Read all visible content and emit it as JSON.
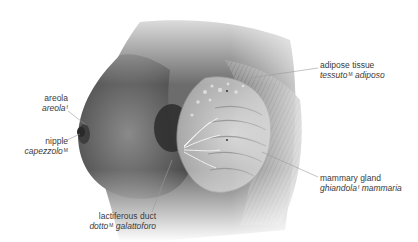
{
  "figure": {
    "languages": [
      "English",
      "Italian"
    ]
  },
  "labels": [
    {
      "id": "areola",
      "en": "areola",
      "it": "areola",
      "gender": "f"
    },
    {
      "id": "nipple",
      "en": "nipple",
      "it": "capezzolo",
      "gender": "M"
    },
    {
      "id": "lactiferous-duct",
      "en": "lactiferous duct",
      "it_word1": "dotto",
      "it_word2": "galattoforo",
      "gender": "M"
    },
    {
      "id": "adipose-tissue",
      "en": "adipose tissue",
      "it_word1": "tessuto",
      "it_word2": "adiposo",
      "gender": "M"
    },
    {
      "id": "mammary-gland",
      "en": "mammary gland",
      "it_word1": "ghiandola",
      "it_word2": "mammaria",
      "gender": "f"
    }
  ],
  "colors": {
    "text": "#3a3a3a",
    "leader_line": "#9a9a9a",
    "skin_dark": "#4a4a4a",
    "skin_mid": "#7a7a7a",
    "gland": "#c8c8c8",
    "background": "#ffffff"
  }
}
